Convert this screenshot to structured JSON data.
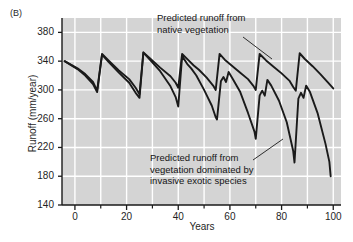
{
  "figure": {
    "panel_label": "(B)",
    "background_color": "#d4d4d4",
    "grid_color": "#ffffff",
    "line_color": "#1a1a1a"
  },
  "annotations": {
    "native": "Predicted runoff from\nnative vegetation",
    "invasive": "Predicted runoff from\nvegetation dominated by\ninvasive exotic species"
  },
  "chart_data": {
    "type": "line",
    "title": "",
    "xlabel": "Years",
    "ylabel": "Runoff (mm/year)",
    "xlim": [
      -5,
      103
    ],
    "ylim": [
      140,
      400
    ],
    "xticks": [
      0,
      20,
      40,
      60,
      80,
      100
    ],
    "xticklabels": [
      "0",
      "20",
      "40",
      "60",
      "80",
      "100"
    ],
    "xminorticks": [
      10,
      30,
      50,
      70,
      90
    ],
    "yticks": [
      140,
      180,
      220,
      260,
      300,
      340,
      380
    ],
    "yticklabels": [
      "140",
      "180",
      "220",
      "260",
      "300",
      "340",
      "380"
    ],
    "grid": true,
    "grid_axis": "both",
    "legend": "annotations-with-leader-lines",
    "series": [
      {
        "name": "Predicted runoff from native vegetation",
        "points": [
          [
            -4,
            340
          ],
          [
            1,
            330
          ],
          [
            4,
            322
          ],
          [
            7,
            311
          ],
          [
            8.6,
            299
          ],
          [
            10.5,
            350
          ],
          [
            13,
            341
          ],
          [
            17,
            327
          ],
          [
            21,
            315
          ],
          [
            23.5,
            303
          ],
          [
            25,
            294
          ],
          [
            26.5,
            352
          ],
          [
            29,
            344
          ],
          [
            33,
            331
          ],
          [
            37,
            319
          ],
          [
            39,
            310
          ],
          [
            40,
            303
          ],
          [
            41.5,
            350
          ],
          [
            44,
            341
          ],
          [
            46,
            334
          ],
          [
            48,
            328
          ],
          [
            51,
            317
          ],
          [
            53.5,
            306
          ],
          [
            54.5,
            300
          ],
          [
            56,
            350
          ],
          [
            58,
            342
          ],
          [
            61,
            333
          ],
          [
            64,
            324
          ],
          [
            67,
            315
          ],
          [
            69,
            306
          ],
          [
            70,
            300
          ],
          [
            71.5,
            350
          ],
          [
            74,
            341
          ],
          [
            77,
            332
          ],
          [
            80,
            323
          ],
          [
            83,
            313
          ],
          [
            84.5,
            304
          ],
          [
            85.5,
            299
          ],
          [
            87,
            351
          ],
          [
            89,
            343
          ],
          [
            92,
            333
          ],
          [
            95,
            322
          ],
          [
            98,
            310
          ],
          [
            100,
            302
          ]
        ]
      },
      {
        "name": "Predicted runoff from vegetation dominated by invasive exotic species",
        "points": [
          [
            -4,
            340
          ],
          [
            1,
            329
          ],
          [
            4,
            320
          ],
          [
            7,
            308
          ],
          [
            8.6,
            297
          ],
          [
            10.5,
            349
          ],
          [
            13,
            339
          ],
          [
            17,
            324
          ],
          [
            21,
            310
          ],
          [
            23.5,
            296
          ],
          [
            25,
            289
          ],
          [
            26.5,
            352
          ],
          [
            29,
            342
          ],
          [
            33,
            326
          ],
          [
            37,
            305
          ],
          [
            39,
            290
          ],
          [
            40,
            277
          ],
          [
            41.5,
            347
          ],
          [
            43.5,
            336
          ],
          [
            45,
            330
          ],
          [
            47,
            320
          ],
          [
            50,
            300
          ],
          [
            53,
            278
          ],
          [
            54.5,
            262
          ],
          [
            55,
            259
          ],
          [
            56.5,
            312
          ],
          [
            57.5,
            318
          ],
          [
            58.5,
            311
          ],
          [
            59.5,
            325
          ],
          [
            61,
            316
          ],
          [
            64,
            297
          ],
          [
            67,
            268
          ],
          [
            69.5,
            242
          ],
          [
            70,
            232
          ],
          [
            71.5,
            292
          ],
          [
            72.5,
            299
          ],
          [
            73.5,
            292
          ],
          [
            74.5,
            314
          ],
          [
            76,
            306
          ],
          [
            79,
            285
          ],
          [
            82,
            255
          ],
          [
            84.5,
            215
          ],
          [
            85,
            199
          ],
          [
            86.5,
            288
          ],
          [
            87.5,
            296
          ],
          [
            88.5,
            289
          ],
          [
            89.5,
            306
          ],
          [
            91,
            297
          ],
          [
            94,
            267
          ],
          [
            97,
            225
          ],
          [
            98.5,
            200
          ],
          [
            99,
            180
          ]
        ]
      }
    ]
  }
}
